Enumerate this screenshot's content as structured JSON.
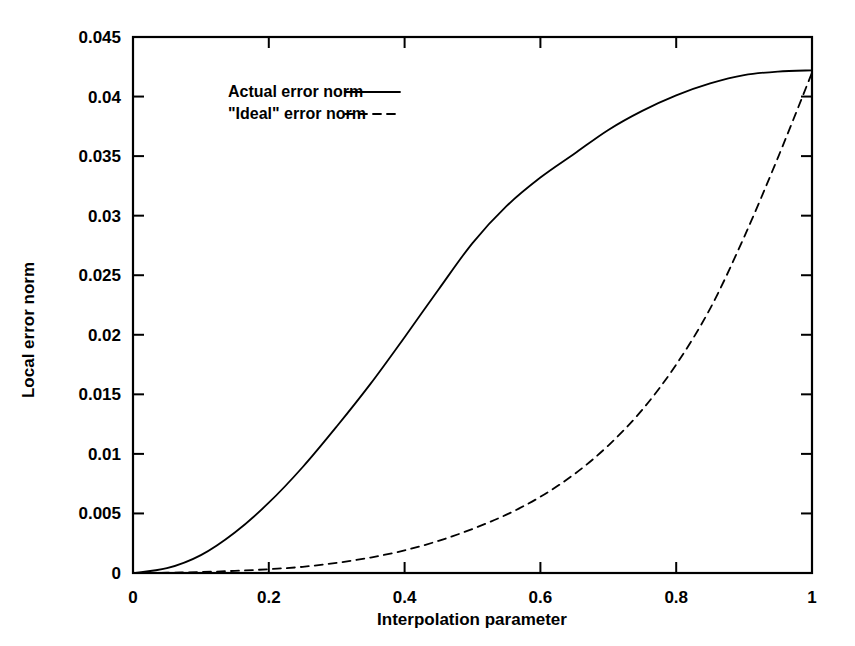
{
  "chart_data": {
    "type": "line",
    "title": "",
    "xlabel": "Interpolation parameter",
    "ylabel": "Local error norm",
    "xlim": [
      0,
      1
    ],
    "ylim": [
      0,
      0.045
    ],
    "grid": false,
    "legend_position": "upper-left-inside",
    "xticks": [
      "0",
      "0.2",
      "0.4",
      "0.6",
      "0.8",
      "1"
    ],
    "xtick_values": [
      0,
      0.2,
      0.4,
      0.6,
      0.8,
      1
    ],
    "yticks": [
      "0",
      "0.005",
      "0.01",
      "0.015",
      "0.02",
      "0.025",
      "0.03",
      "0.035",
      "0.04",
      "0.045"
    ],
    "ytick_values": [
      0,
      0.005,
      0.01,
      0.015,
      0.02,
      0.025,
      0.03,
      0.035,
      0.04,
      0.045
    ],
    "x": [
      0,
      0.05,
      0.1,
      0.15,
      0.2,
      0.25,
      0.3,
      0.35,
      0.4,
      0.45,
      0.5,
      0.55,
      0.6,
      0.65,
      0.7,
      0.75,
      0.8,
      0.85,
      0.9,
      0.95,
      1.0
    ],
    "series": [
      {
        "name": "Actual error norm",
        "style": "solid",
        "values": [
          0.0,
          0.0004,
          0.0015,
          0.0034,
          0.0059,
          0.0089,
          0.0123,
          0.0159,
          0.0198,
          0.0238,
          0.0277,
          0.0308,
          0.0332,
          0.0352,
          0.0372,
          0.0388,
          0.0401,
          0.0411,
          0.0418,
          0.0421,
          0.0422
        ]
      },
      {
        "name": "\"Ideal\" error norm",
        "style": "dashed",
        "values": [
          0.0,
          2e-05,
          8e-05,
          0.00018,
          0.00032,
          0.00052,
          0.00085,
          0.0013,
          0.0019,
          0.0027,
          0.0037,
          0.0049,
          0.0064,
          0.0083,
          0.0107,
          0.0137,
          0.0175,
          0.0222,
          0.0282,
          0.0349,
          0.042
        ]
      }
    ],
    "legend": [
      {
        "label": "Actual error norm",
        "style": "solid"
      },
      {
        "label": "\"Ideal\" error norm",
        "style": "dashed"
      }
    ]
  }
}
